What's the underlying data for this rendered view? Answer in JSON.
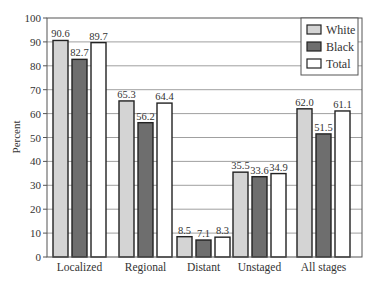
{
  "chart_data": {
    "type": "bar",
    "title": "",
    "xlabel": "",
    "ylabel": "Percent",
    "ylim": [
      0,
      100
    ],
    "yticks": [
      0,
      10,
      20,
      30,
      40,
      50,
      60,
      70,
      80,
      90,
      100
    ],
    "grid": true,
    "legend_position": "top-right",
    "categories": [
      "Localized",
      "Regional",
      "Distant",
      "Unstaged",
      "All stages"
    ],
    "series": [
      {
        "name": "White",
        "color": "#d4d4d4",
        "values": [
          90.6,
          65.3,
          8.5,
          35.5,
          62.0
        ],
        "labels": [
          "90.6",
          "65.3",
          "8.5",
          "35.5",
          "62.0"
        ]
      },
      {
        "name": "Black",
        "color": "#6e6e6e",
        "values": [
          82.7,
          56.2,
          7.1,
          33.6,
          51.5
        ],
        "labels": [
          "82.7",
          "56.2",
          "7.1",
          "33.6",
          "51.5"
        ]
      },
      {
        "name": "Total",
        "color": "#ffffff",
        "values": [
          89.7,
          64.4,
          8.3,
          34.9,
          61.1
        ],
        "labels": [
          "89.7",
          "64.4",
          "8.3",
          "34.9",
          "61.1"
        ]
      }
    ]
  }
}
